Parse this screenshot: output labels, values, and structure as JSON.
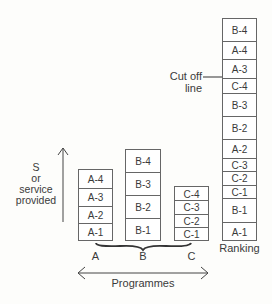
{
  "y_axis": {
    "label_lines": [
      "S",
      "or",
      "service",
      "provided"
    ]
  },
  "x_axis": {
    "label": "Programmes"
  },
  "programmes": [
    {
      "name": "A",
      "items": [
        "A-1",
        "A-2",
        "A-3",
        "A-4"
      ]
    },
    {
      "name": "B",
      "items": [
        "B-1",
        "B-2",
        "B-3",
        "B-4"
      ]
    },
    {
      "name": "C",
      "items": [
        "C-1",
        "C-2",
        "C-3",
        "C-4"
      ]
    }
  ],
  "ranking": {
    "label": "Ranking",
    "items_top_to_bottom": [
      "B-4",
      "A-4",
      "A-3",
      "C-4",
      "B-3",
      "B-2",
      "A-2",
      "C-3",
      "C-2",
      "C-1",
      "B-1",
      "A-1"
    ],
    "cutoff_label": "Cut off line",
    "cutoff_between": [
      "A-3",
      "C-4"
    ]
  }
}
